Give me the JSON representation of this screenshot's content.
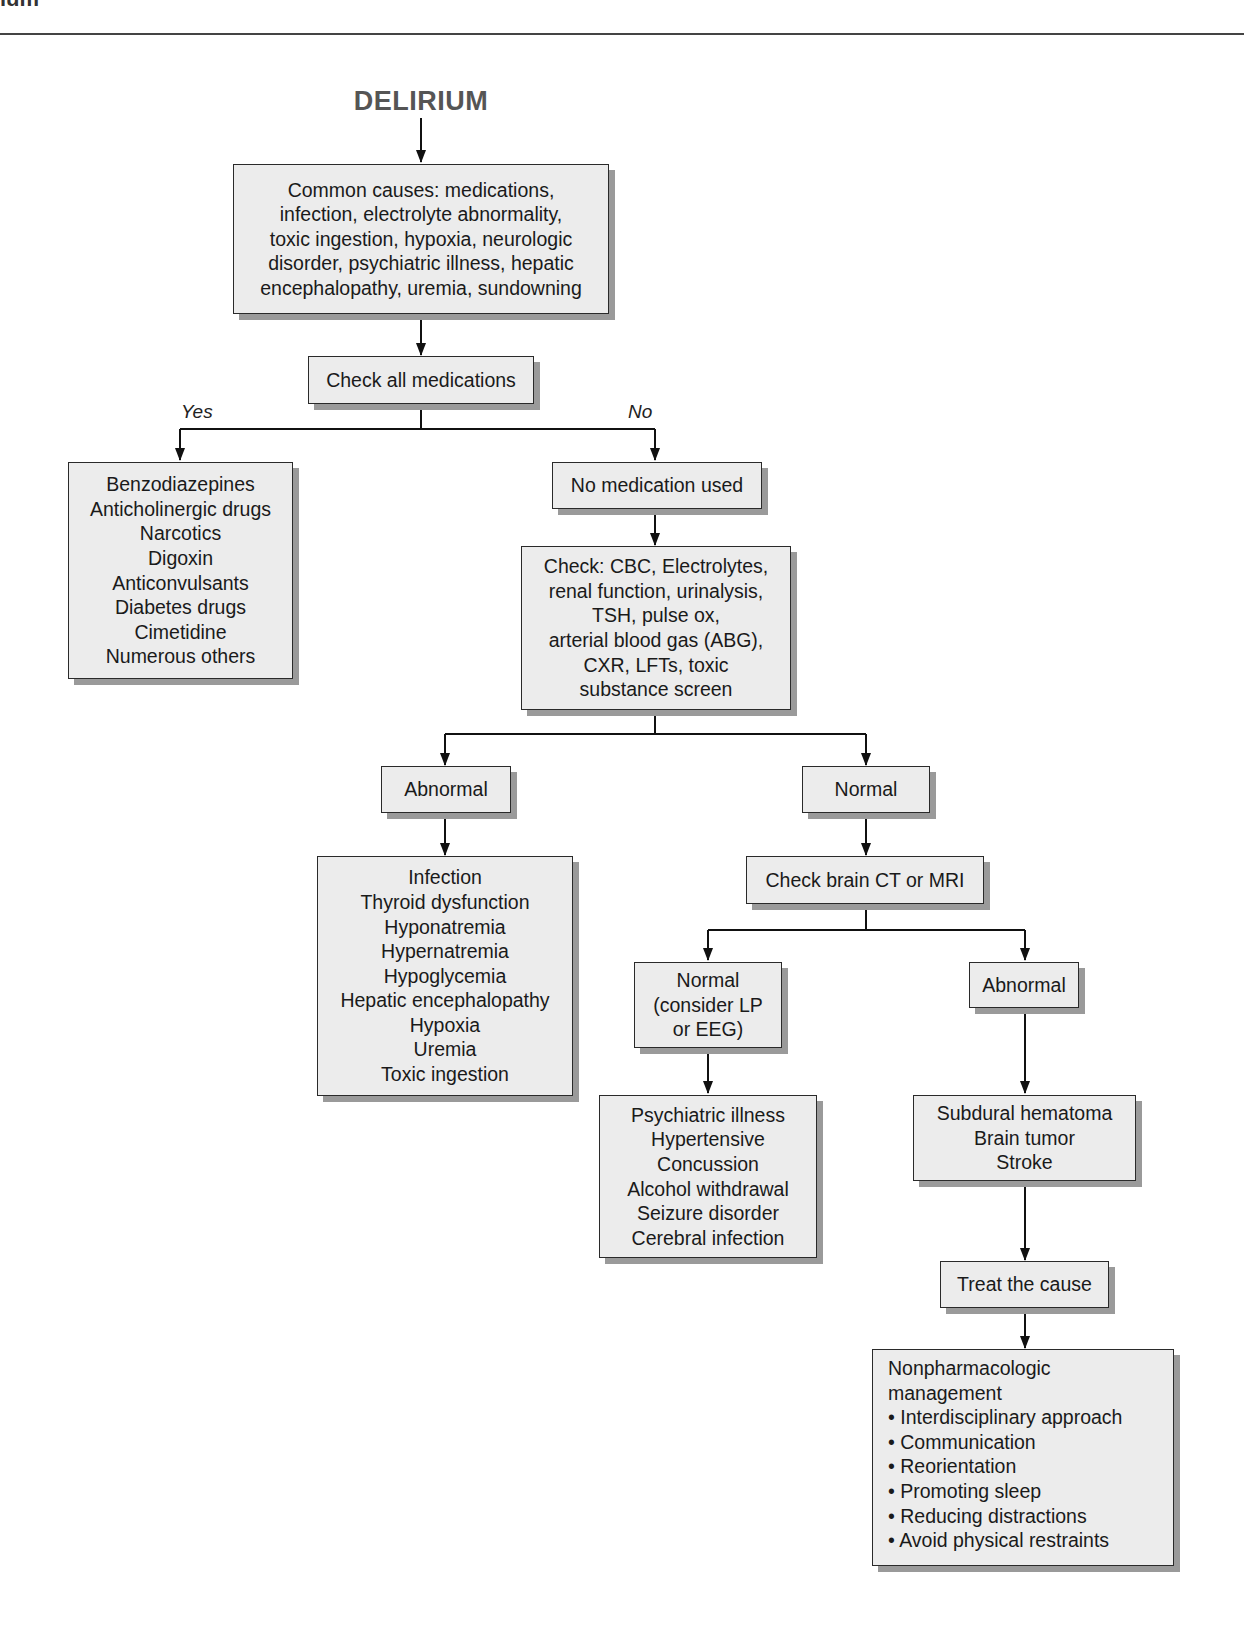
{
  "page": {
    "header_fragment": "ium",
    "title": "DELIRIUM"
  },
  "nodes": {
    "common_causes": {
      "lines": [
        "Common causes: medications,",
        "infection, electrolyte abnormality,",
        "toxic ingestion, hypoxia, neurologic",
        "disorder, psychiatric illness, hepatic",
        "encephalopathy, uremia, sundowning"
      ]
    },
    "check_medications": {
      "lines": [
        "Check all medications"
      ]
    },
    "yes_label": "Yes",
    "no_label": "No",
    "medication_list": {
      "lines": [
        "Benzodiazepines",
        "Anticholinergic drugs",
        "Narcotics",
        "Digoxin",
        "Anticonvulsants",
        "Diabetes drugs",
        "Cimetidine",
        "Numerous others"
      ]
    },
    "no_medication": {
      "lines": [
        "No medication used"
      ]
    },
    "check_labs": {
      "lines": [
        "Check: CBC, Electrolytes,",
        "renal function, urinalysis,",
        "TSH, pulse ox,",
        "arterial blood gas (ABG),",
        "CXR, LFTs, toxic",
        "substance screen"
      ]
    },
    "labs_abnormal": {
      "lines": [
        "Abnormal"
      ]
    },
    "labs_normal": {
      "lines": [
        "Normal"
      ]
    },
    "lab_causes": {
      "lines": [
        "Infection",
        "Thyroid dysfunction",
        "Hyponatremia",
        "Hypernatremia",
        "Hypoglycemia",
        "Hepatic encephalopathy",
        "Hypoxia",
        "Uremia",
        "Toxic ingestion"
      ]
    },
    "check_imaging": {
      "lines": [
        "Check brain CT or MRI"
      ]
    },
    "imaging_normal": {
      "lines": [
        "Normal",
        "(consider LP",
        "or EEG)"
      ]
    },
    "imaging_abnormal": {
      "lines": [
        "Abnormal"
      ]
    },
    "normal_imaging_causes": {
      "lines": [
        "Psychiatric illness",
        "Hypertensive",
        "Concussion",
        "Alcohol withdrawal",
        "Seizure disorder",
        "Cerebral infection"
      ]
    },
    "abnormal_imaging_causes": {
      "lines": [
        "Subdural hematoma",
        "Brain tumor",
        "Stroke"
      ]
    },
    "treat_cause": {
      "lines": [
        "Treat the cause"
      ]
    },
    "nonpharm_management": {
      "lines": [
        "Nonpharmacologic",
        "management",
        "• Interdisciplinary approach",
        "• Communication",
        "• Reorientation",
        "• Promoting sleep",
        "• Reducing distractions",
        "• Avoid physical restraints"
      ]
    }
  },
  "colors": {
    "box_fill": "#ececec",
    "box_border": "#2a2a2a",
    "shadow": "#9a9a9a",
    "title": "#555555",
    "line": "#111111"
  }
}
